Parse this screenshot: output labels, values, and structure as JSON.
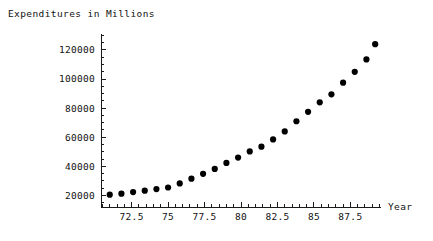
{
  "chart_data": {
    "type": "scatter",
    "title": "Expenditures in Millions",
    "xlabel": "Year",
    "ylabel": "",
    "xlim": [
      70.4,
      89.6
    ],
    "ylim": [
      12000,
      131000
    ],
    "grid": false,
    "legend": null,
    "x_ticks_major": [
      "72.5",
      "75",
      "77.5",
      "80",
      "82.5",
      "85",
      "87.5"
    ],
    "x_tick_values": [
      72.5,
      75,
      77.5,
      80,
      82.5,
      85,
      87.5
    ],
    "x_minor_step": 0.5,
    "y_ticks_major": [
      "20000",
      "40000",
      "60000",
      "80000",
      "100000",
      "120000"
    ],
    "y_tick_values": [
      20000,
      40000,
      60000,
      80000,
      100000,
      120000
    ],
    "y_minor_step": 5000,
    "marker": "filled-circle",
    "marker_color": "#000000",
    "marker_size_px": 4.0,
    "x": [
      71.0,
      71.8,
      72.6,
      73.4,
      74.2,
      75.0,
      75.8,
      76.6,
      77.4,
      78.2,
      79.0,
      79.8,
      80.6,
      81.4,
      82.2,
      83.0,
      83.8,
      84.6,
      85.4,
      86.2,
      87.0,
      87.8,
      88.6,
      89.2
    ],
    "y": [
      20500,
      21200,
      22300,
      23200,
      24300,
      25400,
      28200,
      31500,
      34800,
      38200,
      42300,
      46000,
      50200,
      53500,
      58500,
      64000,
      71000,
      77500,
      84000,
      89500,
      97500,
      105000,
      113500,
      124000
    ],
    "series": [
      {
        "name": "Expenditures",
        "points": [
          [
            71.0,
            20500
          ],
          [
            71.8,
            21200
          ],
          [
            72.6,
            22300
          ],
          [
            73.4,
            23200
          ],
          [
            74.2,
            24300
          ],
          [
            75.0,
            25400
          ],
          [
            75.8,
            28200
          ],
          [
            76.6,
            31500
          ],
          [
            77.4,
            34800
          ],
          [
            78.2,
            38200
          ],
          [
            79.0,
            42300
          ],
          [
            79.8,
            46000
          ],
          [
            80.6,
            50200
          ],
          [
            81.4,
            53500
          ],
          [
            82.2,
            58500
          ],
          [
            83.0,
            64000
          ],
          [
            83.8,
            71000
          ],
          [
            84.6,
            77500
          ],
          [
            85.4,
            84000
          ],
          [
            86.2,
            89500
          ],
          [
            87.0,
            97500
          ],
          [
            87.8,
            105000
          ],
          [
            88.6,
            113500
          ],
          [
            89.2,
            124000
          ]
        ]
      }
    ]
  },
  "colors": {
    "axis": "#1a1a1a",
    "marker": "#000000",
    "text": "#111111",
    "background": "#ffffff"
  }
}
